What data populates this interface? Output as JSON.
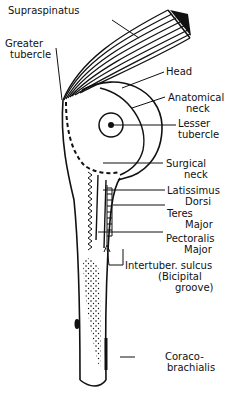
{
  "diagram": {
    "labels": {
      "supraspinatus": {
        "line1": "Supraspinatus"
      },
      "greater_tubercle": {
        "line1": "Greater",
        "line2": "tubercle"
      },
      "head": {
        "line1": "Head"
      },
      "anatomical_neck": {
        "line1": "Anatomical",
        "line2": "neck"
      },
      "lesser_tubercle": {
        "line1": "Lesser",
        "line2": "tubercle"
      },
      "surgical_neck": {
        "line1": "Surgical",
        "line2": "neck"
      },
      "latissimus_dorsi": {
        "line1": "Latissimus",
        "line2": "Dorsi"
      },
      "teres_major": {
        "line1": "Teres",
        "line2": "Major"
      },
      "pectoralis_major": {
        "line1": "Pectoralis",
        "line2": "Major"
      },
      "intertubercular_sulcus": {
        "line1": "Intertuber. sulcus",
        "line2": "(Bicipital",
        "line3": "groove)"
      },
      "coracobrachialis": {
        "line1": "Coraco-",
        "line2": "brachialis"
      }
    },
    "colors": {
      "ink": "#111111",
      "paper": "#ffffff"
    }
  }
}
